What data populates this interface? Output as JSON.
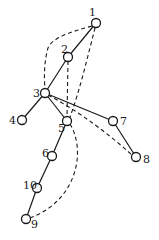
{
  "diagram": {
    "type": "tree-graph",
    "nodes": [
      {
        "id": "1",
        "label": "1",
        "x": 96,
        "y": 23,
        "lx": 89,
        "ly": 16
      },
      {
        "id": "2",
        "label": "2",
        "x": 68,
        "y": 57,
        "lx": 61,
        "ly": 53
      },
      {
        "id": "3",
        "label": "3",
        "x": 45,
        "y": 93,
        "lx": 33,
        "ly": 97
      },
      {
        "id": "4",
        "label": "4",
        "x": 22,
        "y": 120,
        "lx": 9,
        "ly": 124
      },
      {
        "id": "5",
        "label": "5",
        "x": 67,
        "y": 121,
        "lx": 58,
        "ly": 132
      },
      {
        "id": "6",
        "label": "6",
        "x": 52,
        "y": 156,
        "lx": 42,
        "ly": 157
      },
      {
        "id": "7",
        "label": "7",
        "x": 113,
        "y": 121,
        "lx": 120,
        "ly": 125
      },
      {
        "id": "8",
        "label": "8",
        "x": 136,
        "y": 157,
        "lx": 143,
        "ly": 163
      },
      {
        "id": "9",
        "label": "9",
        "x": 26,
        "y": 219,
        "lx": 31,
        "ly": 228
      },
      {
        "id": "10",
        "label": "10",
        "x": 37,
        "y": 188,
        "lx": 23,
        "ly": 189
      }
    ],
    "solid_edges": [
      [
        "1",
        "2"
      ],
      [
        "2",
        "3"
      ],
      [
        "3",
        "4"
      ],
      [
        "3",
        "5"
      ],
      [
        "3",
        "7"
      ],
      [
        "7",
        "8"
      ],
      [
        "5",
        "6"
      ],
      [
        "6",
        "10"
      ],
      [
        "10",
        "9"
      ]
    ],
    "dashed_edges": [
      {
        "from": "1",
        "to": "3",
        "path": "M92 26 C 70 32, 52 38, 48 48 C 44 62, 44 78, 45 89"
      },
      {
        "from": "1",
        "to": "5",
        "path": "M95 28 C 88 55, 80 90, 70 117"
      },
      {
        "from": "2",
        "to": "5",
        "path": "M68 61 L 67 117"
      },
      {
        "from": "3",
        "to": "8",
        "path": "M48 95 C 80 112, 110 135, 132 155"
      },
      {
        "from": "5",
        "to": "9",
        "path": "M70 124 C 86 150, 78 200, 30 218"
      }
    ]
  }
}
